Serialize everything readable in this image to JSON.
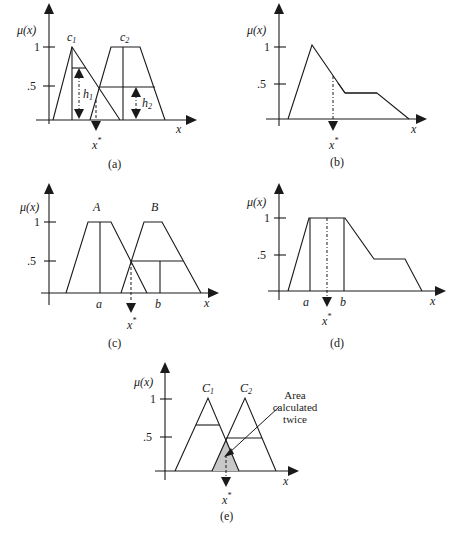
{
  "figure": {
    "panels": [
      {
        "id": "a",
        "caption": "(a)",
        "y_label": "μ(x)",
        "x_label": "x",
        "y_ticks": [
          "1",
          ".5"
        ],
        "sets": [
          "c1",
          "c2"
        ],
        "set_labels": {
          "c1": "c",
          "c1_sub": "1",
          "c2": "c",
          "c2_sub": "2"
        },
        "heights": {
          "h1": "h",
          "h1_sub": "1",
          "h2": "h",
          "h2_sub": "2"
        },
        "output": "x",
        "output_sup": "*"
      },
      {
        "id": "b",
        "caption": "(b)",
        "y_label": "μ(x)",
        "x_label": "x",
        "y_ticks": [
          "1",
          ".5"
        ],
        "output": "x",
        "output_sup": "*"
      },
      {
        "id": "c",
        "caption": "(c)",
        "y_label": "μ(x)",
        "x_label": "x",
        "y_ticks": [
          "1",
          ".5"
        ],
        "sets": [
          "A",
          "B"
        ],
        "x_ticks": [
          "a",
          "b"
        ],
        "output": "x",
        "output_sup": "*"
      },
      {
        "id": "d",
        "caption": "(d)",
        "y_label": "μ(x)",
        "x_label": "x",
        "y_ticks": [
          "1",
          ".5"
        ],
        "x_ticks": [
          "a",
          "b"
        ],
        "output": "x",
        "output_sup": "*"
      },
      {
        "id": "e",
        "caption": "(e)",
        "y_label": "μ(x)",
        "x_label": "x",
        "y_ticks": [
          "1",
          ".5"
        ],
        "set_labels": {
          "c1": "C",
          "c1_sub": "1",
          "c2": "C",
          "c2_sub": "2"
        },
        "annotation": [
          "Area",
          "calculated",
          "twice"
        ],
        "output": "x",
        "output_sup": "*",
        "shade_color": "#c8c8c8"
      }
    ]
  }
}
